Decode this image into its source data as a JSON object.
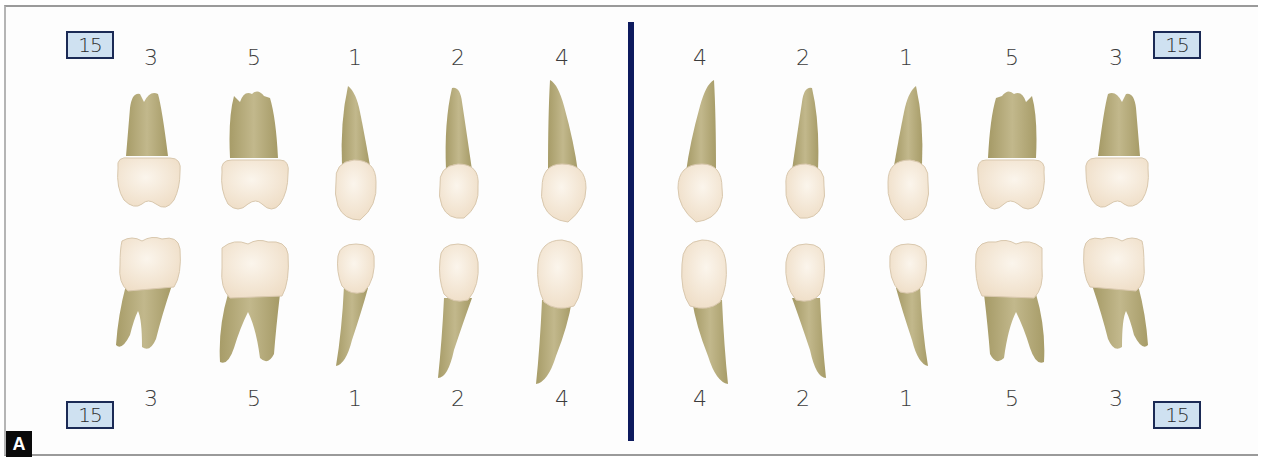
{
  "figure": {
    "panel_label": "A",
    "divider_color": "#0d1a5e",
    "badge_fill": "#cfe1f1",
    "badge_border": "#1b2a55",
    "crown_color": "#f3e6d3",
    "root_color": "#b8ad7e"
  },
  "left_half": {
    "badge_top": "15",
    "badge_bottom": "15",
    "top_labels": [
      "3",
      "5",
      "1",
      "2",
      "4"
    ],
    "bottom_labels": [
      "3",
      "5",
      "1",
      "2",
      "4"
    ],
    "upper_teeth": [
      "molar",
      "molar",
      "premolar",
      "premolar",
      "canine"
    ],
    "lower_teeth": [
      "molar",
      "molar",
      "premolar",
      "premolar",
      "canine"
    ]
  },
  "right_half": {
    "badge_top": "15",
    "badge_bottom": "15",
    "top_labels": [
      "4",
      "2",
      "1",
      "5",
      "3"
    ],
    "bottom_labels": [
      "4",
      "2",
      "1",
      "5",
      "3"
    ],
    "upper_teeth": [
      "canine",
      "premolar",
      "premolar",
      "molar",
      "molar"
    ],
    "lower_teeth": [
      "canine",
      "premolar",
      "premolar",
      "molar",
      "molar"
    ]
  }
}
